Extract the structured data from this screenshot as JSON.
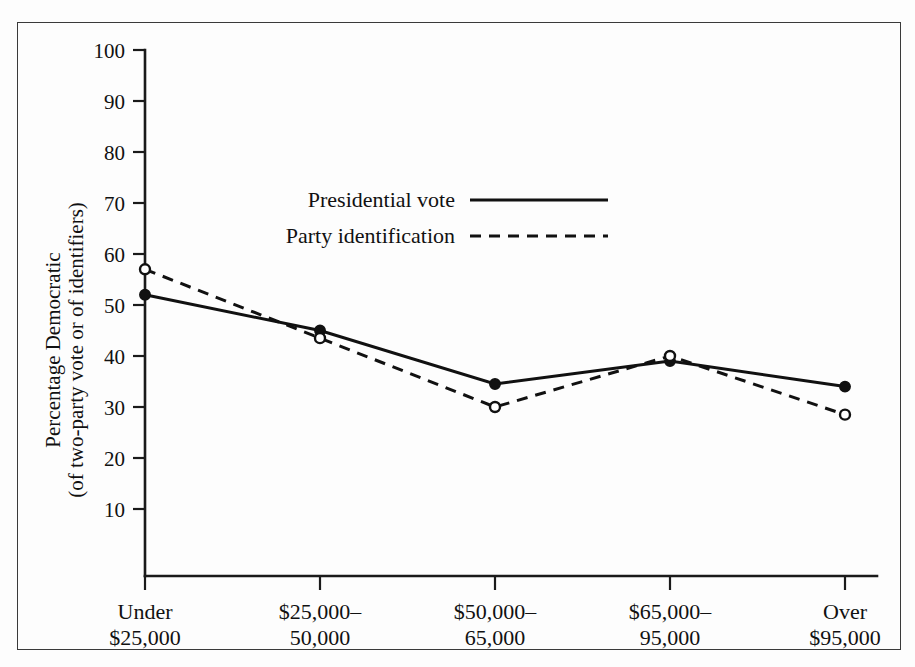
{
  "chart_data": {
    "type": "line",
    "title": "",
    "xlabel": "",
    "ylabel_line1": "Percentage Democratic",
    "ylabel_line2": "(of two-party vote or of identifiers)",
    "categories": [
      {
        "line1": "Under",
        "line2": "$25,000"
      },
      {
        "line1": "$25,000–",
        "line2": "50,000"
      },
      {
        "line1": "$50,000–",
        "line2": "65,000"
      },
      {
        "line1": "$65,000–",
        "line2": "95,000"
      },
      {
        "line1": "Over",
        "line2": "$95,000"
      }
    ],
    "ylim": [
      0,
      100
    ],
    "yticks": [
      100,
      90,
      80,
      70,
      60,
      50,
      40,
      30,
      20,
      10
    ],
    "grid": false,
    "legend_position": "upper-center",
    "series": [
      {
        "name": "Presidential vote",
        "style": "solid",
        "marker": "filled-circle",
        "values": [
          52,
          45,
          34.5,
          39,
          34
        ]
      },
      {
        "name": "Party identification",
        "style": "dashed",
        "marker": "open-circle",
        "values": [
          57,
          43.5,
          30,
          40,
          28.5
        ]
      }
    ],
    "colors": {
      "line": "#111111",
      "axis": "#1a1a1a",
      "frame": "#3a3a3a",
      "background": "#fdfdfd"
    }
  },
  "legend": {
    "items": [
      {
        "label": "Presidential vote",
        "style": "solid"
      },
      {
        "label": "Party identification",
        "style": "dashed"
      }
    ]
  },
  "axis": {
    "y_labels": [
      "100",
      "90",
      "80",
      "70",
      "60",
      "50",
      "40",
      "30",
      "20",
      "10"
    ],
    "y_title_line1": "Percentage Democratic",
    "y_title_line2": "(of two-party vote or of identifiers)"
  },
  "xaxis": {
    "labels": [
      {
        "line1": "Under",
        "line2": "$25,000"
      },
      {
        "line1": "$25,000–",
        "line2": "50,000"
      },
      {
        "line1": "$50,000–",
        "line2": "65,000"
      },
      {
        "line1": "$65,000–",
        "line2": "95,000"
      },
      {
        "line1": "Over",
        "line2": "$95,000"
      }
    ]
  }
}
